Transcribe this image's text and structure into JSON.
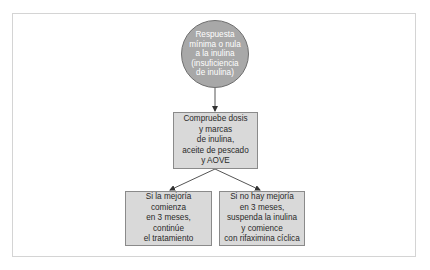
{
  "diagram": {
    "type": "flowchart",
    "colors": {
      "background": "#ffffff",
      "frame_border": "#d4d4d4",
      "circle_fill": "#a8a8a8",
      "circle_text": "#ffffff",
      "box_fill": "#d9d9d9",
      "box_border": "#8a8a8a",
      "box_text": "#2a2a2a",
      "arrow": "#555555"
    },
    "start_node": {
      "shape": "circle",
      "lines": [
        "Respuesta",
        "mínima o nula",
        "a la inulina",
        "(insuficiencia",
        "de inulina)"
      ]
    },
    "check_node": {
      "shape": "rectangle",
      "lines": [
        "Compruebe dosis",
        "y marcas",
        "de inulina,",
        "aceite de pescado",
        "y AOVE"
      ]
    },
    "outcome_improvement": {
      "shape": "rectangle",
      "lines": [
        "Si la mejoría",
        "comienza",
        "en 3 meses,",
        "continúe",
        "el tratamiento"
      ]
    },
    "outcome_no_improvement": {
      "shape": "rectangle",
      "lines": [
        "Si no hay mejoría",
        "en 3 meses,",
        "suspenda la inulina",
        "y comience",
        "con rifaximina cíclica"
      ]
    },
    "edges": [
      {
        "from": "start_node",
        "to": "check_node"
      },
      {
        "from": "check_node",
        "to": "outcome_improvement"
      },
      {
        "from": "check_node",
        "to": "outcome_no_improvement"
      }
    ]
  }
}
